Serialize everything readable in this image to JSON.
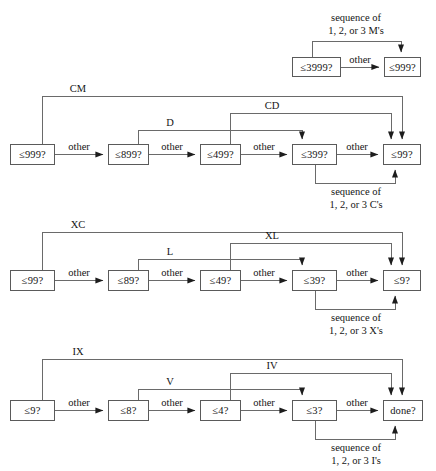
{
  "diagram": {
    "stroke_color": "#5a5a5a",
    "text_color": "#141414",
    "background": "#ffffff",
    "edge_default_label": "other",
    "rows": [
      {
        "id": "thousands",
        "nodes": [
          {
            "id": "n3999",
            "label": "≤3999?",
            "x": 292,
            "y": 57,
            "w": 49,
            "h": 20
          },
          {
            "id": "n999t",
            "label": "≤999?",
            "x": 384,
            "y": 57,
            "w": 37,
            "h": 20
          }
        ],
        "edges": [
          {
            "from": "n3999",
            "to": "n999t",
            "label": "other"
          }
        ],
        "loops": [
          {
            "at": "n3999",
            "to": "n999t",
            "label": "sequence of\n1, 2, or 3 M's",
            "text_line1": "sequence of",
            "text_line2": "1, 2, or 3 M's"
          }
        ]
      },
      {
        "id": "hundreds",
        "nodes": [
          {
            "id": "n999",
            "label": "≤999?",
            "x": 10,
            "y": 144,
            "w": 45,
            "h": 21
          },
          {
            "id": "n899",
            "label": "≤899?",
            "x": 108,
            "y": 144,
            "w": 41,
            "h": 21
          },
          {
            "id": "n499",
            "label": "≤499?",
            "x": 200,
            "y": 144,
            "w": 41,
            "h": 21
          },
          {
            "id": "n399",
            "label": "≤399?",
            "x": 292,
            "y": 144,
            "w": 45,
            "h": 21
          },
          {
            "id": "n99",
            "label": "≤99?",
            "x": 383,
            "y": 144,
            "w": 38,
            "h": 21
          }
        ],
        "edges": [
          {
            "from": "n999",
            "to": "n899",
            "label": "other"
          },
          {
            "from": "n899",
            "to": "n499",
            "label": "other"
          },
          {
            "from": "n499",
            "to": "n399",
            "label": "other"
          },
          {
            "from": "n399",
            "to": "n99",
            "label": "other"
          }
        ],
        "arcs": [
          {
            "label": "CM",
            "from": "n999",
            "to": "n99"
          },
          {
            "label": "CD",
            "from": "n499",
            "to": "n99"
          },
          {
            "label": "D",
            "from": "n899",
            "to": "n399"
          }
        ],
        "loops": [
          {
            "at": "n399",
            "to": "n99",
            "text_line1": "sequence of",
            "text_line2": "1, 2, or 3 C's"
          }
        ]
      },
      {
        "id": "tens",
        "nodes": [
          {
            "id": "t99",
            "label": "≤99?",
            "x": 10,
            "y": 270,
            "w": 45,
            "h": 21
          },
          {
            "id": "t89",
            "label": "≤89?",
            "x": 108,
            "y": 270,
            "w": 41,
            "h": 21
          },
          {
            "id": "t49",
            "label": "≤49?",
            "x": 200,
            "y": 270,
            "w": 41,
            "h": 21
          },
          {
            "id": "t39",
            "label": "≤39?",
            "x": 292,
            "y": 270,
            "w": 45,
            "h": 21
          },
          {
            "id": "t9",
            "label": "≤9?",
            "x": 383,
            "y": 270,
            "w": 38,
            "h": 21
          }
        ],
        "edges": [
          {
            "from": "t99",
            "to": "t89",
            "label": "other"
          },
          {
            "from": "t89",
            "to": "t49",
            "label": "other"
          },
          {
            "from": "t49",
            "to": "t39",
            "label": "other"
          },
          {
            "from": "t39",
            "to": "t9",
            "label": "other"
          }
        ],
        "arcs": [
          {
            "label": "XC",
            "from": "t99",
            "to": "t9"
          },
          {
            "label": "XL",
            "from": "t49",
            "to": "t9"
          },
          {
            "label": "L",
            "from": "t89",
            "to": "t39"
          }
        ],
        "loops": [
          {
            "at": "t39",
            "to": "t9",
            "text_line1": "sequence of",
            "text_line2": "1, 2, or 3 X's"
          }
        ]
      },
      {
        "id": "units",
        "nodes": [
          {
            "id": "u9",
            "label": "≤9?",
            "x": 10,
            "y": 400,
            "w": 45,
            "h": 21
          },
          {
            "id": "u8",
            "label": "≤8?",
            "x": 108,
            "y": 400,
            "w": 41,
            "h": 21
          },
          {
            "id": "u4",
            "label": "≤4?",
            "x": 200,
            "y": 400,
            "w": 41,
            "h": 21
          },
          {
            "id": "u3",
            "label": "≤3?",
            "x": 292,
            "y": 400,
            "w": 45,
            "h": 21
          },
          {
            "id": "done",
            "label": "done?",
            "x": 383,
            "y": 400,
            "w": 40,
            "h": 21
          }
        ],
        "edges": [
          {
            "from": "u9",
            "to": "u8",
            "label": "other"
          },
          {
            "from": "u8",
            "to": "u4",
            "label": "other"
          },
          {
            "from": "u4",
            "to": "u3",
            "label": "other"
          },
          {
            "from": "u3",
            "to": "done",
            "label": "other"
          }
        ],
        "arcs": [
          {
            "label": "IX",
            "from": "u9",
            "to": "done"
          },
          {
            "label": "IV",
            "from": "u4",
            "to": "done"
          },
          {
            "label": "V",
            "from": "u8",
            "to": "u3"
          }
        ],
        "loops": [
          {
            "at": "u3",
            "to": "done",
            "text_line1": "sequence of",
            "text_line2": "1, 2, or 3 I's"
          }
        ]
      }
    ],
    "all_node_labels": [
      "≤3999?",
      "≤999?",
      "≤999?",
      "≤899?",
      "≤499?",
      "≤399?",
      "≤99?",
      "≤99?",
      "≤89?",
      "≤49?",
      "≤39?",
      "≤9?",
      "≤9?",
      "≤8?",
      "≤4?",
      "≤3?",
      "done?"
    ],
    "arc_labels": [
      "CM",
      "CD",
      "D",
      "XC",
      "XL",
      "L",
      "IX",
      "IV",
      "V"
    ],
    "sequence_labels": [
      {
        "l1": "sequence of",
        "l2": "1, 2, or 3 M's"
      },
      {
        "l1": "sequence of",
        "l2": "1, 2, or 3 C's"
      },
      {
        "l1": "sequence of",
        "l2": "1, 2, or 3 X's"
      },
      {
        "l1": "sequence of",
        "l2": "1, 2, or 3 I's"
      }
    ],
    "edge_labels": [
      "other",
      "other",
      "other",
      "other",
      "other",
      "other",
      "other",
      "other",
      "other",
      "other",
      "other",
      "other",
      "other"
    ]
  }
}
